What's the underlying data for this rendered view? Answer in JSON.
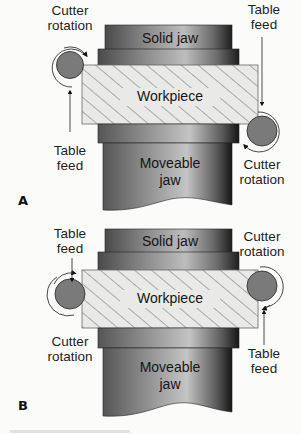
{
  "diagram": {
    "panels": [
      {
        "id": "A",
        "panel_label": "A",
        "parts": {
          "solid_jaw": "Solid jaw",
          "workpiece": "Workpiece",
          "moveable_jaw_line1": "Moveable",
          "moveable_jaw_line2": "jaw"
        },
        "left_cutter": {
          "label_line1": "Cutter",
          "label_line2": "rotation",
          "feed_line1": "Table",
          "feed_line2": "feed",
          "feed_direction": "up"
        },
        "right_cutter": {
          "label_line1": "Cutter",
          "label_line2": "rotation",
          "feed_line1": "Table",
          "feed_line2": "feed",
          "feed_direction": "down"
        }
      },
      {
        "id": "B",
        "panel_label": "B",
        "parts": {
          "solid_jaw": "Solid jaw",
          "workpiece": "Workpiece",
          "moveable_jaw_line1": "Moveable",
          "moveable_jaw_line2": "jaw"
        },
        "left_cutter": {
          "label_line1": "Cutter",
          "label_line2": "rotation",
          "feed_line1": "Table",
          "feed_line2": "feed",
          "feed_direction": "down"
        },
        "right_cutter": {
          "label_line1": "Cutter",
          "label_line2": "rotation",
          "feed_line1": "Table",
          "feed_line2": "feed",
          "feed_direction": "up"
        }
      }
    ],
    "colors": {
      "background": "#fbfbfa",
      "cutter_fill": "#7a7a7a",
      "jaw_dark": "#2a2a2a",
      "jaw_light": "#b0b0b0",
      "workpiece_fill": "#e8e8e6",
      "hatch": "#555555"
    }
  }
}
